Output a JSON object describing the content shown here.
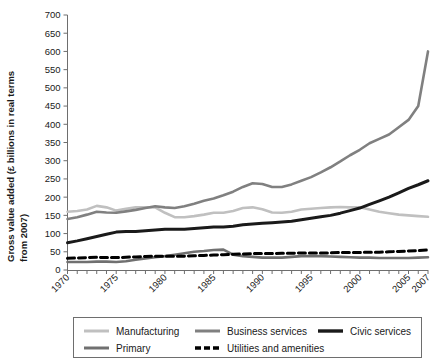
{
  "chart_data": {
    "type": "line",
    "title": "",
    "xlabel": "",
    "ylabel": "Gross value added (£ billions in real terms from 2007)",
    "ylim": [
      0,
      700
    ],
    "ytick_step": 50,
    "yticks": [
      0,
      50,
      100,
      150,
      200,
      250,
      300,
      350,
      400,
      450,
      500,
      550,
      600,
      650,
      700
    ],
    "xlim": [
      1970,
      2007
    ],
    "xticks_labeled": [
      "1970",
      "1975",
      "1980",
      "1985",
      "1990",
      "1995",
      "2000",
      "2005",
      "2007"
    ],
    "xtick_values": [
      1970,
      1975,
      1980,
      1985,
      1990,
      1995,
      2000,
      2005,
      2007
    ],
    "grid": false,
    "legend_position": "bottom",
    "x": [
      1970,
      1971,
      1972,
      1973,
      1974,
      1975,
      1976,
      1977,
      1978,
      1979,
      1980,
      1981,
      1982,
      1983,
      1984,
      1985,
      1986,
      1987,
      1988,
      1989,
      1990,
      1991,
      1992,
      1993,
      1994,
      1995,
      1996,
      1997,
      1998,
      1999,
      2000,
      2001,
      2002,
      2003,
      2004,
      2005,
      2006,
      2007
    ],
    "series": [
      {
        "name": "Manufacturing",
        "color": "#c0c0c0",
        "width": 2.6,
        "dash": "none",
        "values": [
          160,
          162,
          166,
          176,
          172,
          163,
          168,
          172,
          172,
          172,
          157,
          145,
          145,
          148,
          152,
          157,
          157,
          162,
          170,
          172,
          167,
          158,
          157,
          160,
          166,
          168,
          170,
          172,
          173,
          172,
          172,
          166,
          160,
          156,
          152,
          150,
          148,
          146
        ]
      },
      {
        "name": "Business services",
        "color": "#808080",
        "width": 2.6,
        "dash": "none",
        "values": [
          140,
          145,
          152,
          160,
          158,
          157,
          161,
          165,
          170,
          175,
          172,
          170,
          175,
          182,
          190,
          196,
          205,
          215,
          228,
          238,
          236,
          228,
          228,
          235,
          245,
          255,
          268,
          282,
          298,
          315,
          330,
          348,
          360,
          372,
          392,
          412,
          450,
          600
        ]
      },
      {
        "name": "Civic services",
        "color": "#1a1a1a",
        "width": 3.0,
        "dash": "none",
        "values": [
          75,
          80,
          86,
          92,
          98,
          104,
          106,
          106,
          108,
          110,
          112,
          112,
          112,
          114,
          116,
          118,
          118,
          120,
          124,
          126,
          128,
          130,
          132,
          134,
          138,
          142,
          146,
          150,
          156,
          163,
          170,
          180,
          190,
          200,
          212,
          224,
          234,
          245
        ]
      },
      {
        "name": "Primary",
        "color": "#707070",
        "width": 2.6,
        "dash": "none",
        "values": [
          22,
          22,
          22,
          23,
          23,
          22,
          24,
          28,
          32,
          35,
          38,
          42,
          46,
          50,
          52,
          55,
          56,
          42,
          38,
          36,
          34,
          34,
          34,
          36,
          38,
          38,
          38,
          37,
          36,
          35,
          34,
          34,
          33,
          33,
          33,
          33,
          34,
          35
        ]
      },
      {
        "name": "Utilities and amenities",
        "color": "#000000",
        "width": 3.0,
        "dash": "7,4",
        "values": [
          32,
          33,
          34,
          35,
          34,
          34,
          35,
          36,
          37,
          38,
          38,
          38,
          38,
          39,
          40,
          41,
          42,
          43,
          44,
          45,
          45,
          45,
          46,
          46,
          47,
          47,
          47,
          47,
          48,
          48,
          48,
          49,
          49,
          50,
          51,
          52,
          53,
          55
        ]
      }
    ]
  },
  "legend": {
    "entries": [
      {
        "label": "Manufacturing"
      },
      {
        "label": "Business services"
      },
      {
        "label": "Civic services"
      },
      {
        "label": "Primary"
      },
      {
        "label": "Utilities and amenities"
      }
    ]
  }
}
